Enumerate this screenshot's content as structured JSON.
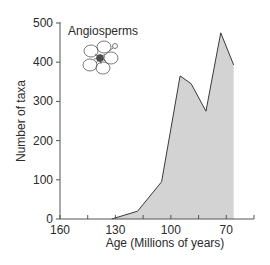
{
  "chart_data": {
    "type": "area",
    "title": "",
    "annotation": "Angiosperms",
    "xlabel": "Age (Millions of years)",
    "ylabel": "Number of taxa",
    "x_reversed": true,
    "xlim": [
      160,
      55
    ],
    "ylim": [
      0,
      500
    ],
    "x_ticks": [
      160,
      145,
      130,
      115,
      100,
      85,
      70,
      55
    ],
    "x_tick_labels": [
      "160",
      "",
      "130",
      "",
      "100",
      "",
      "70",
      ""
    ],
    "y_ticks": [
      0,
      100,
      200,
      300,
      400,
      500
    ],
    "y_tick_labels": [
      "0",
      "100",
      "200",
      "300",
      "400",
      "500"
    ],
    "grid": false,
    "legend": null,
    "series": [
      {
        "name": "Angiosperms",
        "x": [
          132,
          118,
          105,
          95,
          89,
          81,
          73,
          66
        ],
        "values": [
          0,
          20,
          95,
          365,
          345,
          275,
          475,
          393
        ]
      }
    ],
    "fill_color": "#d3d3d3",
    "line_color": "#3a3a3a"
  },
  "labels": {
    "annotation": "Angiosperms",
    "xlabel": "Age (Millions of years)",
    "ylabel": "Number of taxa"
  },
  "illustration": {
    "icon": "flower-sketch-icon"
  }
}
